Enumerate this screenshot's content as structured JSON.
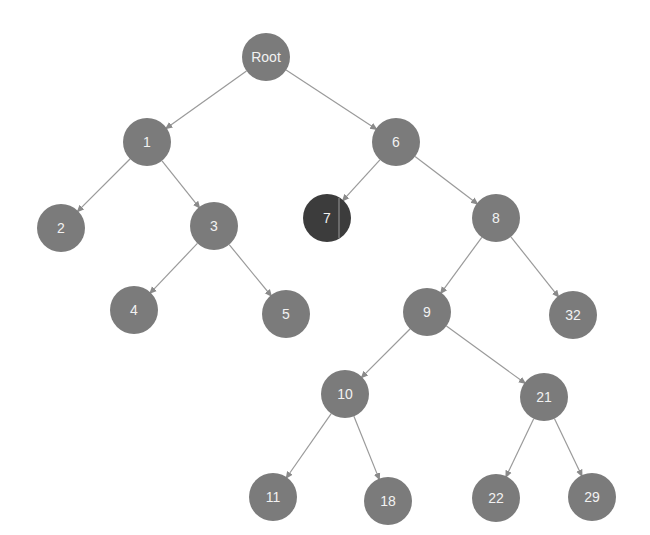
{
  "diagram": {
    "type": "tree",
    "node_color": "#7b7b7b",
    "highlight_color": "#3c3c3c",
    "edge_color": "#9a9a9a",
    "nodes": [
      {
        "id": "root",
        "label": "Root",
        "x": 266,
        "y": 57,
        "highlight": false
      },
      {
        "id": "n1",
        "label": "1",
        "x": 147,
        "y": 142,
        "highlight": false
      },
      {
        "id": "n6",
        "label": "6",
        "x": 396,
        "y": 142,
        "highlight": false
      },
      {
        "id": "n2",
        "label": "2",
        "x": 61,
        "y": 228,
        "highlight": false
      },
      {
        "id": "n3",
        "label": "3",
        "x": 214,
        "y": 226,
        "highlight": false
      },
      {
        "id": "n7",
        "label": "7",
        "x": 327,
        "y": 218,
        "highlight": true
      },
      {
        "id": "n8",
        "label": "8",
        "x": 496,
        "y": 218,
        "highlight": false
      },
      {
        "id": "n4",
        "label": "4",
        "x": 134,
        "y": 310,
        "highlight": false
      },
      {
        "id": "n5",
        "label": "5",
        "x": 286,
        "y": 314,
        "highlight": false
      },
      {
        "id": "n9",
        "label": "9",
        "x": 427,
        "y": 312,
        "highlight": false
      },
      {
        "id": "n32",
        "label": "32",
        "x": 573,
        "y": 315,
        "highlight": false
      },
      {
        "id": "n10",
        "label": "10",
        "x": 345,
        "y": 394,
        "highlight": false
      },
      {
        "id": "n21",
        "label": "21",
        "x": 544,
        "y": 397,
        "highlight": false
      },
      {
        "id": "n11",
        "label": "11",
        "x": 273,
        "y": 497,
        "highlight": false
      },
      {
        "id": "n18",
        "label": "18",
        "x": 388,
        "y": 501,
        "highlight": false
      },
      {
        "id": "n22",
        "label": "22",
        "x": 496,
        "y": 498,
        "highlight": false
      },
      {
        "id": "n29",
        "label": "29",
        "x": 592,
        "y": 497,
        "highlight": false
      }
    ],
    "edges": [
      [
        "root",
        "n1"
      ],
      [
        "root",
        "n6"
      ],
      [
        "n1",
        "n2"
      ],
      [
        "n1",
        "n3"
      ],
      [
        "n3",
        "n4"
      ],
      [
        "n3",
        "n5"
      ],
      [
        "n6",
        "n7"
      ],
      [
        "n6",
        "n8"
      ],
      [
        "n8",
        "n9"
      ],
      [
        "n8",
        "n32"
      ],
      [
        "n9",
        "n10"
      ],
      [
        "n9",
        "n21"
      ],
      [
        "n10",
        "n11"
      ],
      [
        "n10",
        "n18"
      ],
      [
        "n21",
        "n22"
      ],
      [
        "n21",
        "n29"
      ]
    ],
    "node_radius": 24
  }
}
